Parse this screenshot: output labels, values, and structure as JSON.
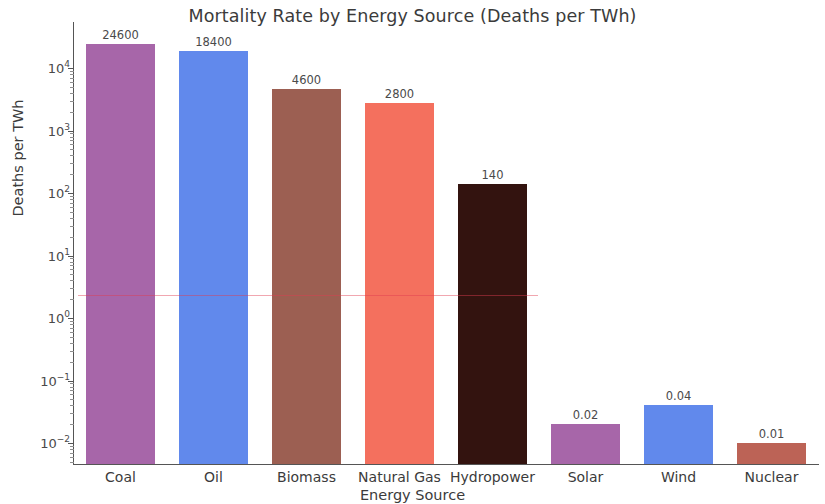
{
  "chart_data": {
    "type": "bar",
    "title": "Mortality Rate by Energy Source (Deaths per TWh)",
    "xlabel": "Energy Source",
    "ylabel": "Deaths per TWh",
    "yscale": "log",
    "ylim": [
      0.01,
      10000
    ],
    "grid": false,
    "legend": "none",
    "categories": [
      "Coal",
      "Oil",
      "Biomass",
      "Natural Gas",
      "Hydropower",
      "Solar",
      "Wind",
      "Nuclear"
    ],
    "values": [
      24600,
      18400,
      4600,
      2800,
      140,
      0.02,
      0.04,
      0.01
    ],
    "value_labels": [
      "24600",
      "18400",
      "4600",
      "2800",
      "140",
      "0.02",
      "0.04",
      "0.01"
    ],
    "bar_colors": [
      "#a766a9",
      "#6189ec",
      "#9c5f52",
      "#f4705e",
      "#33130f",
      "#a766a9",
      "#6189ec",
      "#bc6356"
    ],
    "ytick_labels": [
      "10⁴",
      "10³",
      "10²",
      "10¹",
      "10⁰",
      "10⁻¹",
      "10⁻²"
    ],
    "ytick_values": [
      10000,
      1000,
      100,
      10,
      1,
      0.1,
      0.01
    ],
    "ytick_mantissas": [
      "10",
      "10",
      "10",
      "10",
      "10",
      "10",
      "10"
    ],
    "ytick_exponents": [
      "4",
      "3",
      "2",
      "1",
      "0",
      "−1",
      "−2"
    ]
  }
}
